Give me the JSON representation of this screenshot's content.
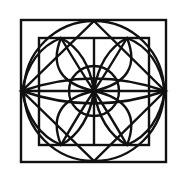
{
  "diagram": {
    "title": "",
    "colors": {
      "background": "#ffffff",
      "stroke": "#111111"
    },
    "center": [
      94,
      91
    ],
    "outer_square": {
      "x": 21,
      "y": 20,
      "size": 145
    },
    "inner_square": {
      "x": 39,
      "y": 38,
      "w": 110,
      "h": 107
    },
    "diamond": {
      "top": [
        94,
        20
      ],
      "right": [
        166,
        91
      ],
      "bottom": [
        94,
        162
      ],
      "left": [
        22,
        91
      ]
    },
    "big_circle_radius": 70,
    "small_circle_radius": 25
  }
}
